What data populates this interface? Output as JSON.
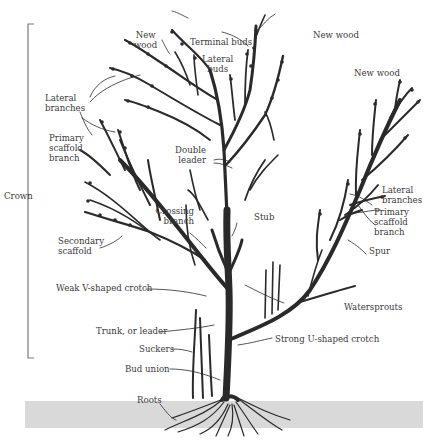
{
  "diagram": {
    "colors": {
      "ink": "#2a2a2a",
      "ground": "#d9d9d9",
      "bracket": "#7a7a7a",
      "text": "#3a3a3a"
    },
    "bracket": {
      "label": "Crown"
    },
    "labels": {
      "new_wood_left": "New\nwood",
      "terminal_buds": "Terminal buds",
      "new_wood_top": "New wood",
      "lateral_buds": "Lateral\nbuds",
      "new_wood_right": "New wood",
      "lateral_branches_left": "Lateral\nbranches",
      "primary_scaffold_left": "Primary\nscaffold\nbranch",
      "double_leader": "Double\nleader",
      "crossing_branch": "Crossing\nbranch",
      "stub": "Stub",
      "secondary_scaffold": "Secondary\nscaffold",
      "lateral_branches_right": "Lateral\nbranches",
      "primary_scaffold_right": "Primary\nscaffold\nbranch",
      "spur": "Spur",
      "weak_crotch": "Weak V-shaped crotch",
      "waterspouts": "Watersprouts",
      "trunk": "Trunk, or leader",
      "strong_crotch": "Strong U-shaped crotch",
      "suckers": "Suckers",
      "bud_union": "Bud union",
      "roots": "Roots"
    }
  }
}
